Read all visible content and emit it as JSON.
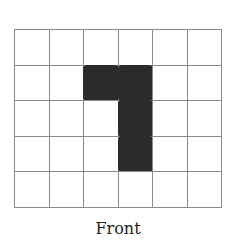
{
  "diagram": {
    "label": "Front",
    "grid": {
      "rows": 5,
      "cols": 6,
      "line_color": "#8a8a8a",
      "fill_color": "#2b2b2b",
      "filled_cells": [
        [
          1,
          2
        ],
        [
          1,
          3
        ],
        [
          2,
          3
        ],
        [
          3,
          3
        ]
      ]
    }
  }
}
